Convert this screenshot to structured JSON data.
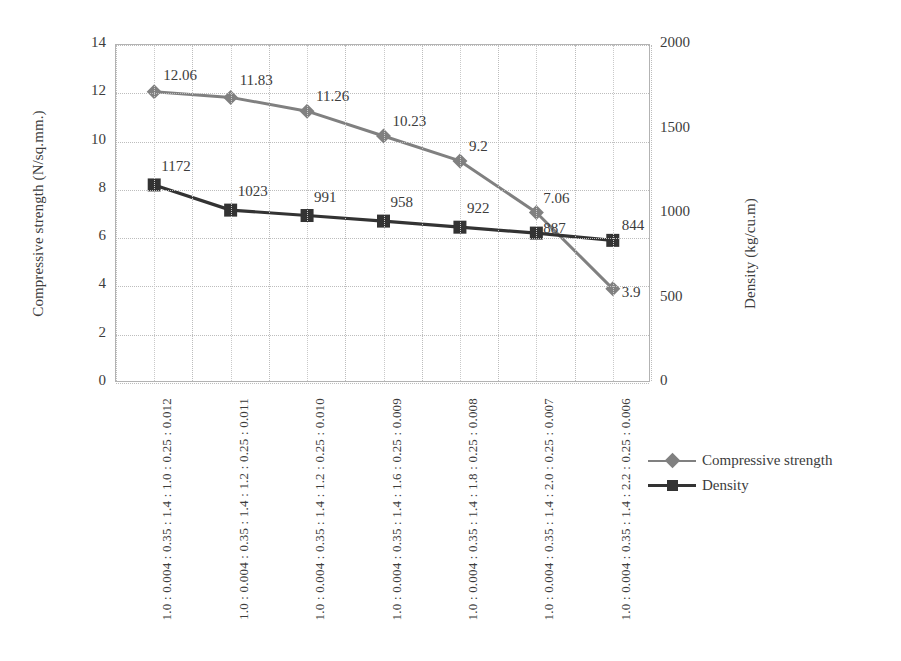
{
  "chart_data": {
    "type": "line",
    "title": "",
    "xlabel": "",
    "ylabel": "Compressive strength (N/sq.mm.)",
    "y2label": "Density (kg/cu.m)",
    "ylim": [
      0,
      14
    ],
    "y2lim": [
      0,
      2000
    ],
    "grid": true,
    "legend_position": "right",
    "categories": [
      "1.0 : 0.004 : 0.35 : 1.4 : 1.0 : 0.25 : 0.012",
      "1.0 : 0.004 : 0.35 : 1.4 : 1.2 : 0.25 : 0.011",
      "1.0 : 0.004 : 0.35 : 1.4 : 1.2 : 0.25 : 0.010",
      "1.0 : 0.004 : 0.35 : 1.4 : 1.6 : 0.25 : 0.009",
      "1.0 : 0.004 : 0.35 : 1.4 : 1.8 : 0.25 : 0.008",
      "1.0 : 0.004 : 0.35 : 1.4 : 2.0 : 0.25 : 0.007",
      "1.0 : 0.004 : 0.35 : 1.4 : 2.2 : 0.25 : 0.006"
    ],
    "yticks": [
      "0",
      "2",
      "4",
      "6",
      "8",
      "10",
      "12",
      "14"
    ],
    "y2ticks": [
      "0",
      "500",
      "1000",
      "1500",
      "2000"
    ],
    "series": [
      {
        "name": "Compressive strength",
        "axis": "left",
        "color": "#808080",
        "marker": "diamond",
        "values": [
          12.06,
          11.83,
          11.26,
          10.23,
          9.2,
          7.06,
          3.9
        ],
        "labels": [
          "12.06",
          "11.83",
          "11.26",
          "10.23",
          "9.2",
          "7.06",
          "3.9"
        ]
      },
      {
        "name": "Density",
        "axis": "right",
        "color": "#333333",
        "marker": "square",
        "values": [
          1172,
          1023,
          991,
          958,
          922,
          887,
          844
        ],
        "labels": [
          "1172",
          "1023",
          "991",
          "958",
          "922",
          "887",
          "844"
        ]
      }
    ]
  },
  "legend": {
    "items": [
      {
        "label": "Compressive strength"
      },
      {
        "label": "Density"
      }
    ]
  }
}
